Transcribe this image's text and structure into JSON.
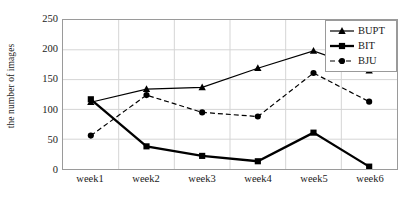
{
  "chart_data": {
    "type": "line",
    "title": "",
    "xlabel": "",
    "ylabel": "the number of images",
    "categories": [
      "week1",
      "week2",
      "week3",
      "week4",
      "week5",
      "week6"
    ],
    "ylim": [
      0,
      250
    ],
    "yticks": [
      0,
      50,
      100,
      150,
      200,
      250
    ],
    "grid": true,
    "legend_position": "top-right",
    "series": [
      {
        "name": "BUPT",
        "marker": "triangle",
        "linestyle": "solid",
        "color": "#000000",
        "values": [
          112,
          134,
          137,
          169,
          198,
          165
        ]
      },
      {
        "name": "BIT",
        "marker": "square",
        "linestyle": "solid-thick",
        "color": "#000000",
        "values": [
          117,
          38,
          22,
          13,
          61,
          4
        ]
      },
      {
        "name": "BJU",
        "marker": "circle",
        "linestyle": "dashed",
        "color": "#000000",
        "values": [
          56,
          124,
          95,
          88,
          161,
          113
        ]
      }
    ]
  },
  "axes": {
    "y_title": "the number of images",
    "y_tick_labels": [
      "250",
      "200",
      "150",
      "100",
      "50",
      "0"
    ],
    "x_tick_labels": [
      "week1",
      "week2",
      "week3",
      "week4",
      "week5",
      "week6"
    ]
  },
  "legend": {
    "entries": [
      {
        "label": "BUPT"
      },
      {
        "label": "BIT"
      },
      {
        "label": "BJU"
      }
    ]
  },
  "colors": {
    "line": "#000000",
    "grid": "#d4d4d4",
    "frame": "#9a9a9a",
    "background": "#ffffff"
  }
}
